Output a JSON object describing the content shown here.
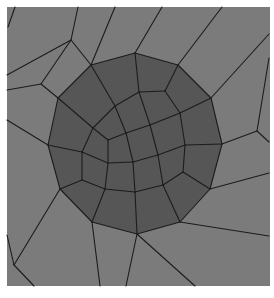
{
  "figure": {
    "colors": {
      "background": "#ffffff",
      "outer_region": "#7b7b7b",
      "inner_region": "#565656",
      "edges": "#1c1c1c"
    },
    "frame": {
      "x": 7,
      "y": 7,
      "width": 263,
      "height": 279
    },
    "inner_boundary": [
      [
        135,
        53
      ],
      [
        178,
        65
      ],
      [
        211,
        98
      ],
      [
        222,
        144
      ],
      [
        210,
        189
      ],
      [
        180,
        222
      ],
      [
        137,
        234
      ],
      [
        92,
        222
      ],
      [
        60,
        189
      ],
      [
        48,
        145
      ],
      [
        58,
        98
      ],
      [
        91,
        65
      ]
    ],
    "edges": [
      [
        [
          8,
          27
        ],
        [
          15,
          7
        ]
      ],
      [
        [
          7,
          75
        ],
        [
          71,
          40
        ]
      ],
      [
        [
          71,
          40
        ],
        [
          78,
          7
        ]
      ],
      [
        [
          71,
          40
        ],
        [
          91,
          65
        ]
      ],
      [
        [
          91,
          65
        ],
        [
          115,
          7
        ]
      ],
      [
        [
          7,
          90
        ],
        [
          41,
          84
        ]
      ],
      [
        [
          41,
          84
        ],
        [
          71,
          40
        ]
      ],
      [
        [
          41,
          84
        ],
        [
          58,
          98
        ]
      ],
      [
        [
          7,
          120
        ],
        [
          48,
          145
        ]
      ],
      [
        [
          135,
          53
        ],
        [
          162,
          7
        ]
      ],
      [
        [
          178,
          65
        ],
        [
          222,
          7
        ]
      ],
      [
        [
          211,
          98
        ],
        [
          269,
          34
        ]
      ],
      [
        [
          222,
          144
        ],
        [
          257,
          131
        ]
      ],
      [
        [
          257,
          131
        ],
        [
          269,
          58
        ]
      ],
      [
        [
          257,
          131
        ],
        [
          269,
          142
        ]
      ],
      [
        [
          210,
          189
        ],
        [
          269,
          173
        ]
      ],
      [
        [
          180,
          222
        ],
        [
          269,
          236
        ]
      ],
      [
        [
          137,
          234
        ],
        [
          195,
          286
        ]
      ],
      [
        [
          137,
          234
        ],
        [
          126,
          286
        ]
      ],
      [
        [
          92,
          222
        ],
        [
          100,
          286
        ]
      ],
      [
        [
          60,
          189
        ],
        [
          14,
          265
        ]
      ],
      [
        [
          14,
          265
        ],
        [
          7,
          235
        ]
      ],
      [
        [
          14,
          265
        ],
        [
          34,
          286
        ]
      ],
      [
        [
          135,
          53
        ],
        [
          139,
          92
        ]
      ],
      [
        [
          178,
          65
        ],
        [
          165,
          91
        ]
      ],
      [
        [
          211,
          98
        ],
        [
          180,
          113
        ]
      ],
      [
        [
          222,
          144
        ],
        [
          185,
          145
        ]
      ],
      [
        [
          210,
          189
        ],
        [
          183,
          172
        ]
      ],
      [
        [
          180,
          222
        ],
        [
          163,
          185
        ]
      ],
      [
        [
          137,
          234
        ],
        [
          135,
          192
        ]
      ],
      [
        [
          92,
          222
        ],
        [
          105,
          189
        ]
      ],
      [
        [
          60,
          189
        ],
        [
          82,
          180
        ]
      ],
      [
        [
          48,
          145
        ],
        [
          82,
          152
        ]
      ],
      [
        [
          58,
          98
        ],
        [
          93,
          128
        ]
      ],
      [
        [
          91,
          65
        ],
        [
          115,
          106
        ]
      ],
      [
        [
          139,
          92
        ],
        [
          165,
          91
        ]
      ],
      [
        [
          165,
          91
        ],
        [
          180,
          113
        ]
      ],
      [
        [
          180,
          113
        ],
        [
          185,
          145
        ]
      ],
      [
        [
          185,
          145
        ],
        [
          183,
          172
        ]
      ],
      [
        [
          183,
          172
        ],
        [
          163,
          185
        ]
      ],
      [
        [
          163,
          185
        ],
        [
          135,
          192
        ]
      ],
      [
        [
          135,
          192
        ],
        [
          105,
          189
        ]
      ],
      [
        [
          105,
          189
        ],
        [
          82,
          180
        ]
      ],
      [
        [
          82,
          180
        ],
        [
          82,
          152
        ]
      ],
      [
        [
          82,
          152
        ],
        [
          93,
          128
        ]
      ],
      [
        [
          93,
          128
        ],
        [
          115,
          106
        ]
      ],
      [
        [
          115,
          106
        ],
        [
          139,
          92
        ]
      ],
      [
        [
          108,
          140
        ],
        [
          126,
          133
        ]
      ],
      [
        [
          126,
          133
        ],
        [
          150,
          125
        ]
      ],
      [
        [
          150,
          125
        ],
        [
          180,
          113
        ]
      ],
      [
        [
          108,
          140
        ],
        [
          93,
          128
        ]
      ],
      [
        [
          108,
          140
        ],
        [
          108,
          163
        ]
      ],
      [
        [
          108,
          163
        ],
        [
          82,
          152
        ]
      ],
      [
        [
          108,
          163
        ],
        [
          133,
          162
        ]
      ],
      [
        [
          133,
          162
        ],
        [
          158,
          155
        ]
      ],
      [
        [
          158,
          155
        ],
        [
          185,
          145
        ]
      ],
      [
        [
          108,
          163
        ],
        [
          105,
          189
        ]
      ],
      [
        [
          133,
          162
        ],
        [
          135,
          192
        ]
      ],
      [
        [
          158,
          155
        ],
        [
          163,
          185
        ]
      ],
      [
        [
          126,
          133
        ],
        [
          115,
          106
        ]
      ],
      [
        [
          126,
          133
        ],
        [
          133,
          162
        ]
      ],
      [
        [
          150,
          125
        ],
        [
          139,
          92
        ]
      ],
      [
        [
          150,
          125
        ],
        [
          158,
          155
        ]
      ]
    ]
  }
}
